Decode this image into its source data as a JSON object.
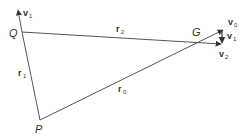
{
  "diagram": {
    "type": "vector-geometry",
    "colors": {
      "line": "#555555",
      "text": "#333333",
      "background": "#ffffff"
    },
    "points": {
      "Q": {
        "label": "Q",
        "x": 22,
        "y": 32
      },
      "G": {
        "label": "G",
        "x": 210,
        "y": 38
      },
      "P": {
        "label": "P",
        "x": 40,
        "y": 120
      }
    },
    "segments": [
      {
        "id": "r1",
        "label": "r",
        "sub": "1",
        "from": "Q",
        "to": "P"
      },
      {
        "id": "r2",
        "label": "r",
        "sub": "2",
        "from": "Q",
        "to": "G"
      },
      {
        "id": "r0",
        "label": "r",
        "sub": "0",
        "from": "P",
        "to": "G"
      }
    ],
    "vectors": [
      {
        "id": "v1_at_Q",
        "label": "v",
        "sub": "1",
        "at": "Q",
        "direction": "up"
      },
      {
        "id": "v0",
        "label": "v",
        "sub": "0",
        "at": "G",
        "direction": "along r0"
      },
      {
        "id": "v1_at_G",
        "label": "v",
        "sub": "1",
        "at": "G",
        "direction": "down"
      },
      {
        "id": "v2",
        "label": "v",
        "sub": "2",
        "at": "G",
        "direction": "along r2"
      }
    ],
    "labels": {
      "Q": "Q",
      "G": "G",
      "P": "P",
      "r": "r",
      "v": "v",
      "sub0": "0",
      "sub1": "1",
      "sub2": "2"
    }
  }
}
